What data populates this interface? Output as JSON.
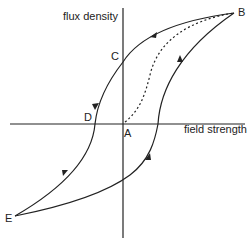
{
  "diagram": {
    "y_axis_label": "flux density",
    "x_axis_label": "field strength",
    "points": {
      "A": "A",
      "B": "B",
      "C": "C",
      "D": "D",
      "E": "E"
    },
    "colors": {
      "line": "#222222",
      "background": "#ffffff"
    }
  }
}
